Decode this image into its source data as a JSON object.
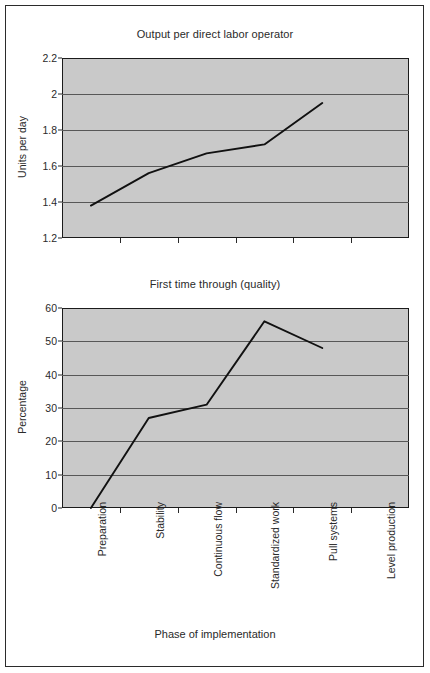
{
  "figure": {
    "background": "#ffffff",
    "frame_color": "#2b2b2b",
    "plot_background": "#c9c9c9",
    "gridline_color": "#575757",
    "series_color": "#111111",
    "xaxis_title": "Phase of implementation",
    "categories": [
      "Preparation",
      "Stability",
      "Continuous flow",
      "Standardized work",
      "Pull systems",
      "Level production"
    ]
  },
  "chart_data": [
    {
      "type": "line",
      "title": "Output per direct labor operator",
      "xlabel": "Phase of implementation",
      "ylabel": "Units per day",
      "categories": [
        "Preparation",
        "Stability",
        "Continuous flow",
        "Standardized work",
        "Pull systems",
        "Level production"
      ],
      "values": [
        1.38,
        1.56,
        1.67,
        1.72,
        1.95,
        null
      ],
      "ylim": [
        1.2,
        2.2
      ],
      "yticks": [
        1.2,
        1.4,
        1.6,
        1.8,
        2.0,
        2.2
      ],
      "ytick_labels": [
        "1.2",
        "1.4",
        "1.6",
        "1.8",
        "2",
        "2.2"
      ],
      "grid": true,
      "legend": false
    },
    {
      "type": "line",
      "title": "First time through (quality)",
      "xlabel": "Phase of implementation",
      "ylabel": "Percentage",
      "categories": [
        "Preparation",
        "Stability",
        "Continuous flow",
        "Standardized work",
        "Pull systems",
        "Level production"
      ],
      "values": [
        0,
        27,
        31,
        56,
        48,
        null
      ],
      "ylim": [
        0,
        60
      ],
      "yticks": [
        0,
        10,
        20,
        30,
        40,
        50,
        60
      ],
      "ytick_labels": [
        "0",
        "10",
        "20",
        "30",
        "40",
        "50",
        "60"
      ],
      "grid": true,
      "legend": false
    }
  ]
}
